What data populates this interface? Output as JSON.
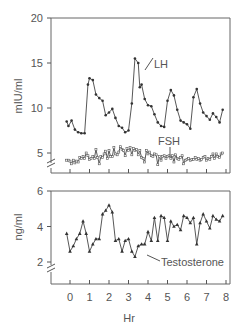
{
  "chart_data": [
    {
      "type": "line",
      "panel": "upper",
      "ylabel": "mIU/ml",
      "xlabel": "",
      "ylim": [
        3.5,
        20
      ],
      "yticks": [
        5,
        10,
        15,
        20
      ],
      "xticks": [
        0,
        1,
        2,
        3,
        4,
        5,
        6,
        7,
        8
      ],
      "grid": false,
      "axis_break": "y",
      "series": [
        {
          "name": "LH",
          "marker": "dot",
          "x": [
            -0.17,
            -0.08,
            0.08,
            0.25,
            0.42,
            0.58,
            0.75,
            0.92,
            1.0,
            1.17,
            1.33,
            1.5,
            1.67,
            1.83,
            2.0,
            2.17,
            2.33,
            2.5,
            2.67,
            2.83,
            3.0,
            3.17,
            3.33,
            3.5,
            3.58,
            3.67,
            3.83,
            4.0,
            4.17,
            4.33,
            4.5,
            4.67,
            4.83,
            5.0,
            5.17,
            5.33,
            5.5,
            5.67,
            5.83,
            6.0,
            6.17,
            6.33,
            6.5,
            6.67,
            6.83,
            7.0,
            7.17,
            7.33,
            7.5,
            7.67,
            7.83
          ],
          "values": [
            8.5,
            8.0,
            8.6,
            7.6,
            7.3,
            7.2,
            7.2,
            12.6,
            13.3,
            13.1,
            11.5,
            11.1,
            10.8,
            9.2,
            9.5,
            9.9,
            8.9,
            8.0,
            7.8,
            7.3,
            7.5,
            10.5,
            15.5,
            15.0,
            12.3,
            12.6,
            11.0,
            10.3,
            10.2,
            9.3,
            8.4,
            8.0,
            7.9,
            10.8,
            12.0,
            11.4,
            9.8,
            8.6,
            8.4,
            8.2,
            7.7,
            11.2,
            12.1,
            10.5,
            9.5,
            9.1,
            8.7,
            9.4,
            9.0,
            8.4,
            9.8
          ]
        },
        {
          "name": "FSH",
          "marker": "square-open",
          "x": [
            -0.17,
            -0.08,
            0.0,
            0.08,
            0.17,
            0.25,
            0.33,
            0.42,
            0.5,
            0.58,
            0.67,
            0.75,
            0.83,
            0.92,
            1.0,
            1.08,
            1.17,
            1.25,
            1.33,
            1.42,
            1.5,
            1.58,
            1.67,
            1.75,
            1.83,
            1.92,
            2.0,
            2.08,
            2.17,
            2.25,
            2.33,
            2.42,
            2.5,
            2.58,
            2.67,
            2.75,
            2.83,
            2.92,
            3.0,
            3.08,
            3.17,
            3.25,
            3.33,
            3.42,
            3.5,
            3.58,
            3.67,
            3.75,
            3.83,
            3.92,
            4.0,
            4.08,
            4.17,
            4.25,
            4.33,
            4.42,
            4.5,
            4.58,
            4.67,
            4.75,
            4.83,
            4.92,
            5.0,
            5.08,
            5.17,
            5.25,
            5.33,
            5.42,
            5.5,
            5.58,
            5.67,
            5.75,
            5.83,
            5.92,
            6.0,
            6.08,
            6.17,
            6.25,
            6.33,
            6.42,
            6.5,
            6.58,
            6.67,
            6.75,
            6.83,
            6.92,
            7.0,
            7.08,
            7.17,
            7.25,
            7.33,
            7.42,
            7.5,
            7.58,
            7.67,
            7.75,
            7.83
          ],
          "values": [
            4.2,
            4.2,
            4.1,
            3.8,
            4.2,
            3.9,
            4.1,
            4.0,
            4.5,
            4.4,
            4.6,
            4.4,
            5.0,
            4.7,
            4.3,
            4.4,
            4.6,
            4.4,
            5.4,
            4.5,
            3.8,
            4.6,
            4.5,
            4.9,
            5.2,
            4.4,
            5.3,
            4.6,
            4.6,
            5.6,
            4.9,
            4.8,
            5.1,
            5.7,
            5.4,
            5.3,
            4.7,
            5.5,
            5.3,
            5.6,
            4.8,
            5.5,
            5.3,
            5.4,
            4.8,
            5.3,
            4.5,
            4.4,
            4.0,
            5.3,
            4.9,
            5.1,
            4.7,
            4.6,
            4.9,
            4.8,
            3.7,
            4.6,
            4.2,
            4.6,
            4.7,
            4.4,
            4.6,
            4.7,
            4.4,
            4.7,
            4.0,
            4.8,
            4.4,
            4.3,
            4.5,
            4.7,
            3.8,
            4.2,
            4.3,
            4.4,
            4.2,
            4.3,
            4.3,
            4.5,
            4.3,
            4.4,
            4.2,
            4.3,
            4.5,
            4.6,
            4.2,
            4.4,
            4.3,
            4.6,
            4.9,
            4.4,
            4.9,
            4.6,
            4.5,
            4.9,
            5.0
          ]
        }
      ],
      "annotations": [
        {
          "text": "LH",
          "x": 3.6,
          "y": 14.9
        },
        {
          "text": "FSH",
          "x": 3.7,
          "y": 6.2
        }
      ]
    },
    {
      "type": "line",
      "panel": "lower",
      "ylabel": "ng/ml",
      "xlabel": "Hr",
      "ylim": [
        1.2,
        6
      ],
      "yticks": [
        2,
        4,
        6
      ],
      "xticks": [
        0,
        1,
        2,
        3,
        4,
        5,
        6,
        7,
        8
      ],
      "xlim": [
        -1,
        8.1
      ],
      "grid": false,
      "axis_break": "y",
      "series": [
        {
          "name": "Testosterone",
          "marker": "triangle",
          "x": [
            -0.17,
            0.0,
            0.17,
            0.33,
            0.5,
            0.67,
            0.83,
            1.0,
            1.17,
            1.33,
            1.5,
            1.67,
            1.83,
            2.0,
            2.17,
            2.33,
            2.5,
            2.67,
            2.83,
            3.0,
            3.17,
            3.33,
            3.5,
            3.67,
            3.83,
            4.0,
            4.17,
            4.33,
            4.5,
            4.67,
            4.83,
            5.0,
            5.17,
            5.33,
            5.5,
            5.67,
            5.83,
            6.0,
            6.17,
            6.33,
            6.5,
            6.67,
            6.83,
            7.0,
            7.17,
            7.33,
            7.5,
            7.67,
            7.83
          ],
          "values": [
            3.6,
            2.6,
            2.9,
            3.3,
            3.6,
            4.3,
            3.6,
            2.6,
            3.0,
            3.3,
            3.3,
            4.7,
            4.9,
            5.2,
            4.8,
            3.2,
            3.3,
            2.6,
            3.2,
            3.3,
            2.6,
            2.3,
            2.9,
            3.0,
            3.0,
            3.7,
            3.2,
            4.5,
            3.2,
            4.6,
            4.5,
            3.2,
            4.3,
            4.0,
            4.1,
            3.8,
            4.6,
            4.5,
            4.2,
            4.5,
            3.0,
            4.2,
            4.7,
            4.3,
            3.9,
            4.6,
            4.4,
            4.3,
            4.6
          ]
        }
      ],
      "annotations": [
        {
          "text": "Testosterone",
          "x": 4.2,
          "y": 2.2
        }
      ]
    }
  ],
  "labels": {
    "upper_ylabel": "mIU/ml",
    "lower_ylabel": "ng/ml",
    "xlabel": "Hr",
    "upper_yticks": [
      "20",
      "15",
      "10",
      "5"
    ],
    "lower_yticks": [
      "6",
      "4",
      "2"
    ],
    "xticks": [
      "0",
      "1",
      "2",
      "3",
      "4",
      "5",
      "6",
      "7",
      "8"
    ],
    "lh_annotation": "LH",
    "fsh_annotation": "FSH",
    "testosterone_annotation": "Testosterone"
  },
  "colors": {
    "line": "#444444",
    "axis": "#666666",
    "text": "#555555"
  }
}
